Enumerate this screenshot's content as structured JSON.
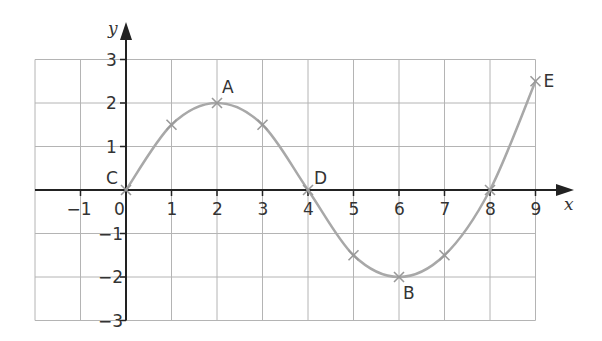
{
  "chart_data": {
    "type": "line",
    "title": "",
    "xlabel": "x",
    "ylabel": "y",
    "xlim": [
      -2,
      9
    ],
    "ylim": [
      -3,
      3
    ],
    "grid": true,
    "x_ticks": [
      -1,
      0,
      1,
      2,
      3,
      4,
      5,
      6,
      7,
      8,
      9
    ],
    "x_tick_labels": [
      "−1",
      "0",
      "1",
      "2",
      "3",
      "4",
      "5",
      "6",
      "7",
      "8",
      "9"
    ],
    "y_ticks": [
      3,
      2,
      1,
      -1,
      -2,
      -3
    ],
    "y_tick_labels": [
      "3",
      "2",
      "1",
      "−1",
      "−2",
      "−3"
    ],
    "series": [
      {
        "name": "curve",
        "x": [
          0,
          1,
          2,
          3,
          4,
          5,
          6,
          7,
          8,
          9
        ],
        "y": [
          0,
          1.5,
          2,
          1.5,
          0,
          -1.5,
          -2,
          -1.5,
          0,
          2.5
        ]
      }
    ],
    "annotations": [
      {
        "label": "C",
        "x": 0,
        "y": 0
      },
      {
        "label": "A",
        "x": 2,
        "y": 2
      },
      {
        "label": "D",
        "x": 4,
        "y": 0
      },
      {
        "label": "B",
        "x": 6,
        "y": -2
      },
      {
        "label": "E",
        "x": 9,
        "y": 2.5
      }
    ],
    "legend": null
  }
}
